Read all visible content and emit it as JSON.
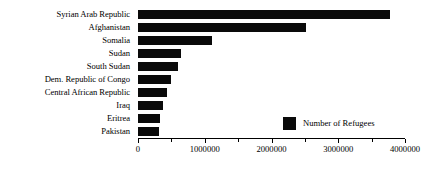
{
  "chart_data": {
    "type": "bar",
    "orientation": "horizontal",
    "title": "",
    "xlabel": "",
    "ylabel": "",
    "categories": [
      "Syrian Arab Republic",
      "Afghanistan",
      "Somalia",
      "Sudan",
      "South Sudan",
      "Dem. Republic of Congo",
      "Central African Republic",
      "Iraq",
      "Eritrea",
      "Pakistan"
    ],
    "values": [
      3770000,
      2510000,
      1110000,
      640000,
      600000,
      500000,
      430000,
      370000,
      330000,
      310000
    ],
    "series": [
      {
        "name": "Number of Refugees",
        "color": "#0a0a0a",
        "values": [
          3770000,
          2510000,
          1110000,
          640000,
          600000,
          500000,
          430000,
          370000,
          330000,
          310000
        ]
      }
    ],
    "xlim": [
      0,
      4000000
    ],
    "xticks": [
      0,
      1000000,
      2000000,
      3000000,
      4000000
    ],
    "xtick_labels": [
      "0",
      "1000000",
      "2000000",
      "3000000",
      "4000000"
    ],
    "xminor_ticks": [
      500000,
      1500000,
      2500000,
      3500000
    ],
    "grid": false,
    "legend": {
      "position": "inside-lower-right",
      "entries": [
        {
          "label": "Number of Refugees",
          "color": "#0a0a0a"
        }
      ]
    }
  },
  "colors": {
    "bar": "#0a0a0a",
    "axis": "#000000",
    "background": "#ffffff",
    "text": "#000000"
  }
}
